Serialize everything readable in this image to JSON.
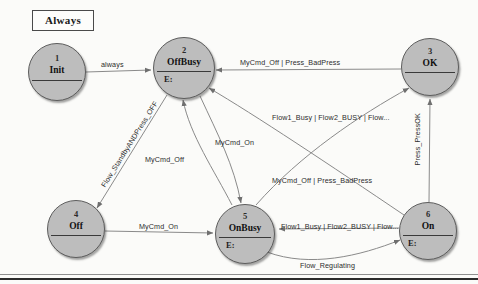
{
  "diagram": {
    "title": "Always",
    "type": "state-machine",
    "states": [
      {
        "id": "1",
        "number": "1",
        "name": "Init",
        "entry": "",
        "cx": 57,
        "cy": 72,
        "r": 29
      },
      {
        "id": "2",
        "number": "2",
        "name": "OffBusy",
        "entry": "E:",
        "cx": 184,
        "cy": 68,
        "r": 31
      },
      {
        "id": "3",
        "number": "3",
        "name": "OK",
        "entry": "",
        "cx": 430,
        "cy": 67,
        "r": 29
      },
      {
        "id": "4",
        "number": "4",
        "name": "Off",
        "entry": "",
        "cx": 76,
        "cy": 229,
        "r": 29
      },
      {
        "id": "5",
        "number": "5",
        "name": "OnBusy",
        "entry": "E:",
        "cx": 245,
        "cy": 234,
        "r": 30
      },
      {
        "id": "6",
        "number": "6",
        "name": "On",
        "entry": "E:",
        "cx": 428,
        "cy": 231,
        "r": 29
      }
    ],
    "transitions": [
      {
        "id": "t1",
        "from": "1",
        "to": "2",
        "label": "always"
      },
      {
        "id": "t2",
        "from": "3",
        "to": "2",
        "label": "MyCmd_Off | Press_BadPress"
      },
      {
        "id": "t3",
        "from": "2",
        "to": "4",
        "label": "Flow_StandbyANDPress_OFF"
      },
      {
        "id": "t4",
        "from": "5",
        "to": "2",
        "label": "MyCmd_Off"
      },
      {
        "id": "t5",
        "from": "2",
        "to": "5",
        "label": "MyCmd_On"
      },
      {
        "id": "t6",
        "from": "5",
        "to": "3",
        "label": "Flow1_Busy | Flow2_BUSY | Flow..."
      },
      {
        "id": "t7",
        "from": "6",
        "to": "2",
        "label": "MyCmd_Off | Press_BadPress"
      },
      {
        "id": "t8",
        "from": "6",
        "to": "3",
        "label": "Press_PressOK"
      },
      {
        "id": "t9",
        "from": "4",
        "to": "5",
        "label": "MyCmd_On"
      },
      {
        "id": "t10",
        "from": "6",
        "to": "5",
        "label": "Flow1_Busy | Flow2_BUSY | Flow..."
      },
      {
        "id": "t11",
        "from": "5",
        "to": "6",
        "label": "Flow_Regulating"
      }
    ],
    "labels": {
      "always": "always",
      "mycmd_off_press_badpress_top": "MyCmd_Off | Press_BadPress",
      "flow_standby_and_press_off": "Flow_StandbyANDPress_OFF",
      "mycmd_off_mid": "MyCmd_Off",
      "mycmd_on_mid": "MyCmd_On",
      "flow_busy_upper": "Flow1_Busy | Flow2_BUSY | Flow...",
      "press_pressok": "Press_PressOK",
      "mycmd_off_press_badpress_mid": "MyCmd_Off | Press_BadPress",
      "mycmd_on_lower": "MyCmd_On",
      "flow_busy_lower": "Flow1_Busy | Flow2_BUSY | Flow...",
      "flow_regulating": "Flow_Regulating"
    },
    "colors": {
      "node_fill": "#bdbdbd",
      "node_stroke": "#5d5d5d",
      "edge_stroke": "#7a7a7a",
      "text": "#1b1b1b",
      "background": "#fbfbf9",
      "frame": "#2b2b2b"
    }
  }
}
